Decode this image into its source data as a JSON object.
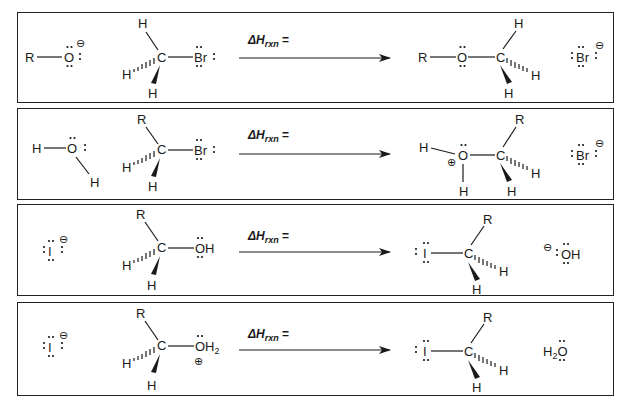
{
  "figure": {
    "colors": {
      "ink": "#1a1a1a",
      "border": "#222222",
      "background": "#ffffff"
    },
    "arrow_label": "ΔHrxn =",
    "arrow_label_main": "ΔH",
    "arrow_label_sub": "rxn",
    "arrow_label_eq": "="
  },
  "reactions": [
    {
      "id": 1,
      "nucleophile": {
        "atoms": [
          "R",
          "O"
        ],
        "charge": "⊖",
        "label": "R–O⁻"
      },
      "substrate": {
        "center": "C",
        "substituents": [
          "H",
          "H",
          "H"
        ],
        "leaving_group": "Br",
        "label": "CH3Br"
      },
      "product": {
        "atoms": [
          "R",
          "O",
          "C"
        ],
        "substituents": [
          "H",
          "H",
          "H"
        ],
        "label": "R–O–CH3"
      },
      "byproduct": {
        "label": "Br",
        "charge": "⊖"
      }
    },
    {
      "id": 2,
      "nucleophile": {
        "atoms": [
          "H",
          "O",
          "H"
        ],
        "charge": "",
        "label": "H2O"
      },
      "substrate": {
        "center": "C",
        "substituents": [
          "R",
          "H",
          "H"
        ],
        "leaving_group": "Br",
        "label": "RCH2Br"
      },
      "product": {
        "atoms": [
          "H",
          "O",
          "H",
          "C"
        ],
        "charge": "⊕",
        "substituents": [
          "R",
          "H",
          "H"
        ],
        "label": "H2O⁺–CH2R"
      },
      "byproduct": {
        "label": "Br",
        "charge": "⊖"
      }
    },
    {
      "id": 3,
      "nucleophile": {
        "atoms": [
          "I"
        ],
        "charge": "⊖",
        "label": "I⁻"
      },
      "substrate": {
        "center": "C",
        "substituents": [
          "R",
          "H",
          "H"
        ],
        "leaving_group": "OH",
        "label": "RCH2OH"
      },
      "product": {
        "atoms": [
          "I",
          "C"
        ],
        "substituents": [
          "R",
          "H",
          "H"
        ],
        "label": "I–CH2R"
      },
      "byproduct": {
        "label": "OH",
        "charge": "⊖"
      }
    },
    {
      "id": 4,
      "nucleophile": {
        "atoms": [
          "I"
        ],
        "charge": "⊖",
        "label": "I⁻"
      },
      "substrate": {
        "center": "C",
        "substituents": [
          "R",
          "H",
          "H"
        ],
        "leaving_group": "OH2",
        "leaving_group_charge": "⊕",
        "label": "RCH2OH2⁺"
      },
      "product": {
        "atoms": [
          "I",
          "C"
        ],
        "substituents": [
          "R",
          "H",
          "H"
        ],
        "label": "I–CH2R"
      },
      "byproduct": {
        "label": "H2O",
        "charge": ""
      }
    }
  ]
}
